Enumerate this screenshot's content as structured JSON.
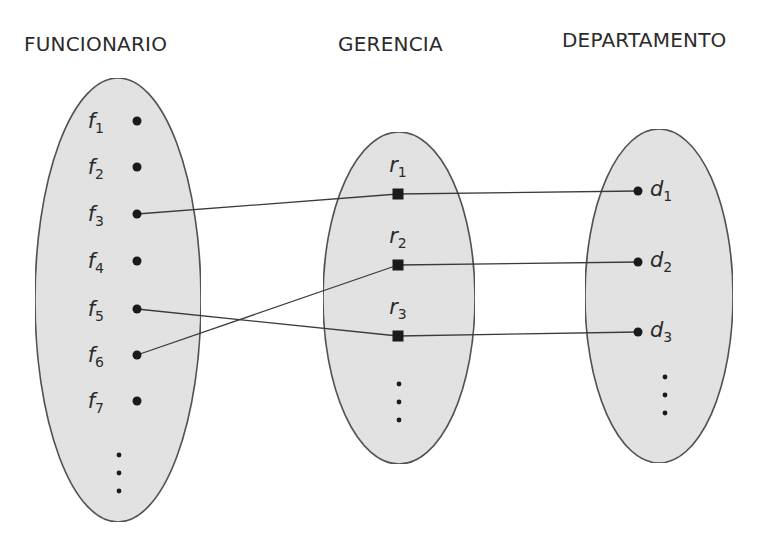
{
  "titles": {
    "funcionario": "FUNCIONARIO",
    "gerencia": "GERENCIA",
    "departamento": "DEPARTAMENTO"
  },
  "colors": {
    "ellipse_fill": "#e3e3e3",
    "ellipse_stroke": "#4a4a4a",
    "line": "#3a3a3a",
    "node": "#1a1a1a"
  },
  "funcionario": {
    "elements": [
      {
        "base": "f",
        "sub": "1"
      },
      {
        "base": "f",
        "sub": "2"
      },
      {
        "base": "f",
        "sub": "3"
      },
      {
        "base": "f",
        "sub": "4"
      },
      {
        "base": "f",
        "sub": "5"
      },
      {
        "base": "f",
        "sub": "6"
      },
      {
        "base": "f",
        "sub": "7"
      }
    ],
    "continues": true
  },
  "gerencia": {
    "elements": [
      {
        "base": "r",
        "sub": "1"
      },
      {
        "base": "r",
        "sub": "2"
      },
      {
        "base": "r",
        "sub": "3"
      }
    ],
    "continues": true
  },
  "departamento": {
    "elements": [
      {
        "base": "d",
        "sub": "1"
      },
      {
        "base": "d",
        "sub": "2"
      },
      {
        "base": "d",
        "sub": "3"
      }
    ],
    "continues": true
  },
  "relationships": [
    {
      "gerencia": "r1",
      "funcionario": "f3",
      "departamento": "d1"
    },
    {
      "gerencia": "r2",
      "funcionario": "f6",
      "departamento": "d2"
    },
    {
      "gerencia": "r3",
      "funcionario": "f5",
      "departamento": "d3"
    }
  ]
}
